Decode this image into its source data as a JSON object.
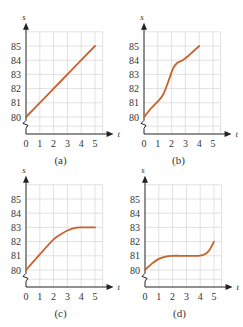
{
  "chart_data": [
    {
      "id": "a",
      "type": "line",
      "caption": "(a)",
      "xlabel": "t",
      "ylabel": "s",
      "xticks": [
        "0",
        "1",
        "2",
        "3",
        "4",
        "5"
      ],
      "yticks": [
        "80",
        "81",
        "82",
        "83",
        "84",
        "85"
      ],
      "xlim": [
        0,
        5.5
      ],
      "ylim": [
        79,
        86
      ],
      "grid": true,
      "axis_break": true,
      "x": [
        0,
        1,
        2,
        3,
        4,
        5
      ],
      "y": [
        80,
        81,
        82,
        83,
        84,
        85
      ]
    },
    {
      "id": "b",
      "type": "line",
      "caption": "(b)",
      "xlabel": "t",
      "ylabel": "s",
      "xticks": [
        "0",
        "1",
        "2",
        "3",
        "4",
        "5"
      ],
      "yticks": [
        "80",
        "81",
        "82",
        "83",
        "84",
        "85"
      ],
      "xlim": [
        0,
        5.5
      ],
      "ylim": [
        79,
        86
      ],
      "grid": true,
      "axis_break": true,
      "x": [
        0,
        0.5,
        1,
        1.4,
        1.8,
        2.1,
        2.4,
        2.8,
        3.2,
        3.6,
        4
      ],
      "y": [
        80,
        80.6,
        81.1,
        81.6,
        82.6,
        83.4,
        83.8,
        84.0,
        84.3,
        84.65,
        85
      ]
    },
    {
      "id": "c",
      "type": "line",
      "caption": "(c)",
      "xlabel": "t",
      "ylabel": "s",
      "xticks": [
        "0",
        "1",
        "2",
        "3",
        "4",
        "5"
      ],
      "yticks": [
        "80",
        "81",
        "82",
        "83",
        "84",
        "85"
      ],
      "xlim": [
        0,
        5.5
      ],
      "ylim": [
        79,
        86
      ],
      "grid": true,
      "axis_break": true,
      "x": [
        0,
        1,
        2,
        2.5,
        3,
        3.5,
        4,
        4.5,
        5
      ],
      "y": [
        80,
        81.1,
        82.15,
        82.5,
        82.78,
        82.95,
        83,
        83,
        83
      ]
    },
    {
      "id": "d",
      "type": "line",
      "caption": "(d)",
      "xlabel": "t",
      "ylabel": "s",
      "xticks": [
        "0",
        "1",
        "2",
        "3",
        "4",
        "5"
      ],
      "yticks": [
        "80",
        "81",
        "82",
        "83",
        "84",
        "85"
      ],
      "xlim": [
        0,
        5.5
      ],
      "ylim": [
        79,
        86
      ],
      "grid": true,
      "axis_break": true,
      "x": [
        0,
        0.5,
        1,
        1.5,
        2,
        2.5,
        3,
        3.5,
        4,
        4.4,
        4.7,
        5
      ],
      "y": [
        80,
        80.45,
        80.78,
        80.95,
        81,
        81,
        81,
        81,
        81.02,
        81.15,
        81.45,
        82
      ]
    }
  ],
  "style": {
    "line_color": "#c8622a",
    "grid_color": "#d9d9d9",
    "axis_color": "#222222"
  }
}
